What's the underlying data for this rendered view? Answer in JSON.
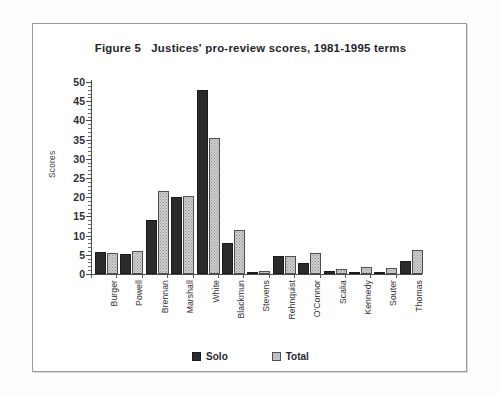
{
  "figure": {
    "title": "Figure 5   Justices' pro-review scores, 1981-1995 terms"
  },
  "legend": {
    "items": [
      {
        "label": "Solo",
        "swatch": "dark-solid-swatch",
        "color": "#2b2b2d"
      },
      {
        "label": "Total",
        "swatch": "light-stippled-swatch",
        "color": "#cfcfcf"
      }
    ]
  },
  "axes": {
    "y_title": "Scores",
    "y_ticks": [
      "50",
      "45",
      "40",
      "35",
      "30",
      "25",
      "20",
      "15",
      "10",
      "5",
      "0"
    ]
  },
  "chart_data": {
    "type": "bar",
    "title": "Figure 5   Justices' pro-review scores, 1981-1995 terms",
    "xlabel": "",
    "ylabel": "Scores",
    "ylim": [
      0,
      50
    ],
    "ytick_step": 5,
    "grid": false,
    "legend_position": "bottom-center",
    "categories": [
      "Burger",
      "Powell",
      "Brennan",
      "Marshall",
      "White",
      "Blackmun",
      "Stevens",
      "Rehnquist",
      "O'Connor",
      "Scalia",
      "Kennedy",
      "Souter",
      "Thomas"
    ],
    "series": [
      {
        "name": "Solo",
        "color": "#2b2b2d",
        "values": [
          5.8,
          5.2,
          14.0,
          20.0,
          48.0,
          8.0,
          0.3,
          4.6,
          2.8,
          0.8,
          0.6,
          0.3,
          3.3
        ]
      },
      {
        "name": "Total",
        "color": "#cfcfcf",
        "values": [
          5.4,
          6.0,
          21.5,
          20.3,
          35.5,
          11.5,
          0.9,
          4.7,
          5.6,
          1.2,
          1.8,
          1.6,
          6.2
        ]
      }
    ]
  }
}
